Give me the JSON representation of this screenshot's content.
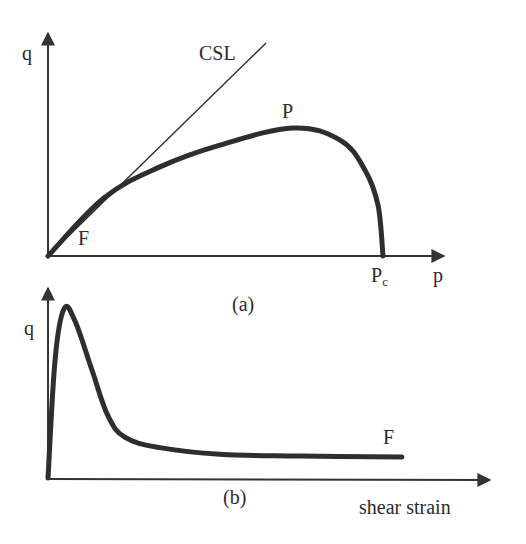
{
  "figure": {
    "panel_a": {
      "caption": "(a)",
      "y_axis_label": "q",
      "x_axis_label": "p",
      "csl_label": "CSL",
      "peak_label": "P",
      "failure_label": "F",
      "pc_label_main": "P",
      "pc_label_sub": "c"
    },
    "panel_b": {
      "caption": "(b)",
      "y_axis_label": "q",
      "x_axis_label": "shear strain",
      "failure_label": "F"
    },
    "colors": {
      "line": "#2e2e2e",
      "text": "#2b2b2b",
      "background": "#ffffff"
    }
  },
  "chart_data": [
    {
      "type": "line",
      "title": "(a)",
      "xlabel": "p",
      "ylabel": "q",
      "xlim": [
        0,
        1.18
      ],
      "ylim": [
        0,
        0.67
      ],
      "grid": false,
      "units": "normalized (p / Pc)",
      "series": [
        {
          "name": "CSL",
          "x": [
            0,
            0.651
          ],
          "y": [
            0,
            0.636
          ]
        },
        {
          "name": "stress path",
          "x": [
            0,
            0.167,
            0.334,
            0.513,
            0.731,
            0.872,
            0.946,
            0.985,
            1.0
          ],
          "y": [
            0,
            0.173,
            0.266,
            0.331,
            0.382,
            0.346,
            0.257,
            0.152,
            0
          ]
        }
      ],
      "annotations": [
        {
          "text": "CSL",
          "x": 0.58,
          "y": 0.62
        },
        {
          "text": "P",
          "x": 0.731,
          "y": 0.382
        },
        {
          "text": "F",
          "x": 0.13,
          "y": 0.08
        },
        {
          "text": "Pc",
          "x": 1.0,
          "y": 0
        }
      ]
    },
    {
      "type": "line",
      "title": "(b)",
      "xlabel": "shear strain",
      "ylabel": "q",
      "xlim": [
        0,
        1.25
      ],
      "ylim": [
        0,
        1.13
      ],
      "grid": false,
      "units": "normalized (q / q_peak)",
      "series": [
        {
          "name": "q vs shear strain",
          "x": [
            0,
            0.02,
            0.045,
            0.076,
            0.124,
            0.169,
            0.218,
            0.316,
            0.486,
            0.712,
            1.0
          ],
          "y": [
            0,
            0.7,
            1.0,
            0.93,
            0.64,
            0.37,
            0.24,
            0.18,
            0.14,
            0.13,
            0.124
          ]
        }
      ],
      "annotations": [
        {
          "text": "F",
          "x": 0.98,
          "y": 0.22
        }
      ]
    }
  ]
}
